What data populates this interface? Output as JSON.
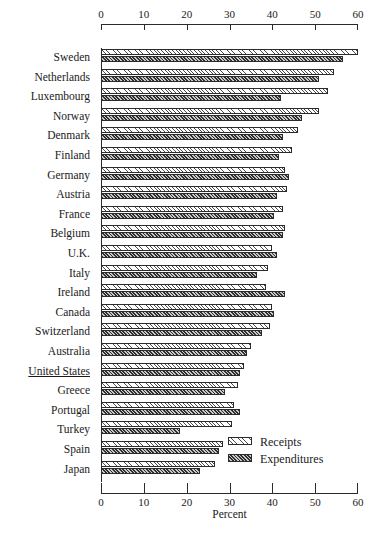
{
  "chart_data": {
    "type": "bar",
    "orientation": "horizontal",
    "title": "",
    "xlabel": "Percent",
    "ylabel": "",
    "xlim": [
      0,
      60
    ],
    "xticks": [
      0,
      10,
      20,
      30,
      40,
      50,
      60
    ],
    "grid": false,
    "legend_position": "bottom-right",
    "legend": [
      "Receipts",
      "Expenditures"
    ],
    "categories": [
      "Sweden",
      "Netherlands",
      "Luxembourg",
      "Norway",
      "Denmark",
      "Finland",
      "Germany",
      "Austria",
      "France",
      "Belgium",
      "U.K.",
      "Italy",
      "Ireland",
      "Canada",
      "Switzerland",
      "Australia",
      "United States",
      "Greece",
      "Portugal",
      "Turkey",
      "Spain",
      "Japan"
    ],
    "highlighted_category": "United States",
    "series": [
      {
        "name": "Receipts",
        "values": [
          60.0,
          54.5,
          53.0,
          51.0,
          46.0,
          44.5,
          43.0,
          43.5,
          42.5,
          43.0,
          40.0,
          39.0,
          38.5,
          40.0,
          39.5,
          35.0,
          33.5,
          32.0,
          31.0,
          30.5,
          28.5,
          26.5
        ]
      },
      {
        "name": "Expenditures",
        "values": [
          56.5,
          51.0,
          42.0,
          47.0,
          42.5,
          41.5,
          44.0,
          41.0,
          40.5,
          42.5,
          41.0,
          36.5,
          43.0,
          40.5,
          37.5,
          34.0,
          32.5,
          29.0,
          32.5,
          18.5,
          27.5,
          23.0
        ]
      }
    ]
  },
  "axis": {
    "top_ticklabels": [
      "0",
      "10",
      "20",
      "30",
      "40",
      "50",
      "60"
    ],
    "bottom_ticklabels": [
      "0",
      "10",
      "20",
      "30",
      "40",
      "50",
      "60"
    ],
    "xtitle": "Percent"
  },
  "legend": {
    "receipts_label": "Receipts",
    "expenditures_label": "Expenditures"
  },
  "caption": {
    "text": ""
  },
  "colors": {
    "ink": "#2b2b2b",
    "receipts_fill": "#ffffff",
    "expenditures_fill": "#8a8a8a",
    "background": "#ffffff"
  }
}
